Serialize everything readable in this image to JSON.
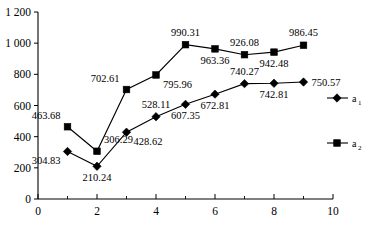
{
  "chart_data": {
    "type": "line",
    "title": "",
    "subtitle": "",
    "xlabel": "",
    "ylabel": "",
    "xlim": [
      0,
      10
    ],
    "ylim": [
      0,
      1200
    ],
    "grid": false,
    "legend_position": "right",
    "x": [
      1,
      2,
      3,
      4,
      5,
      6,
      7,
      8,
      9
    ],
    "xticks": [
      0,
      2,
      4,
      6,
      8,
      10
    ],
    "xtick_labels": [
      "0",
      "2",
      "4",
      "6",
      "8",
      "10"
    ],
    "xminor_ticks": [
      1,
      3,
      5,
      7,
      9
    ],
    "yticks": [
      0,
      200,
      400,
      600,
      800,
      1000,
      1200
    ],
    "ytick_labels": [
      "0",
      "200",
      "400",
      "600",
      "800",
      "1 000",
      "1 200"
    ],
    "series": [
      {
        "name": "a",
        "subscript": "1",
        "marker": "diamond",
        "color": "#000000",
        "values": [
          304.83,
          210.24,
          428.62,
          528.11,
          607.35,
          672.81,
          740.27,
          742.81,
          750.57
        ],
        "labels": [
          "304.83",
          "210.24",
          "428.62",
          "528.11",
          "607.35",
          "672.81",
          "740.27",
          "742.81",
          "750.57"
        ],
        "label_positions": [
          "below-left",
          "below",
          "below-right",
          "above",
          "below",
          "below",
          "above",
          "below",
          "right"
        ]
      },
      {
        "name": "a",
        "subscript": "2",
        "marker": "square",
        "color": "#000000",
        "values": [
          463.68,
          306.29,
          702.61,
          795.96,
          990.31,
          963.36,
          926.08,
          942.48,
          986.45
        ],
        "labels": [
          "463.68",
          "306.29",
          "702.61",
          "795.96",
          "990.31",
          "963.36",
          "926.08",
          "942.48",
          "986.45"
        ],
        "label_positions": [
          "above-left",
          "above-right",
          "above-left",
          "below-right",
          "above",
          "below",
          "above",
          "below",
          "above"
        ]
      }
    ]
  },
  "legend": {
    "entries": [
      {
        "label": "a",
        "subscript": "1",
        "marker": "diamond"
      },
      {
        "label": "a",
        "subscript": "2",
        "marker": "square"
      }
    ]
  }
}
